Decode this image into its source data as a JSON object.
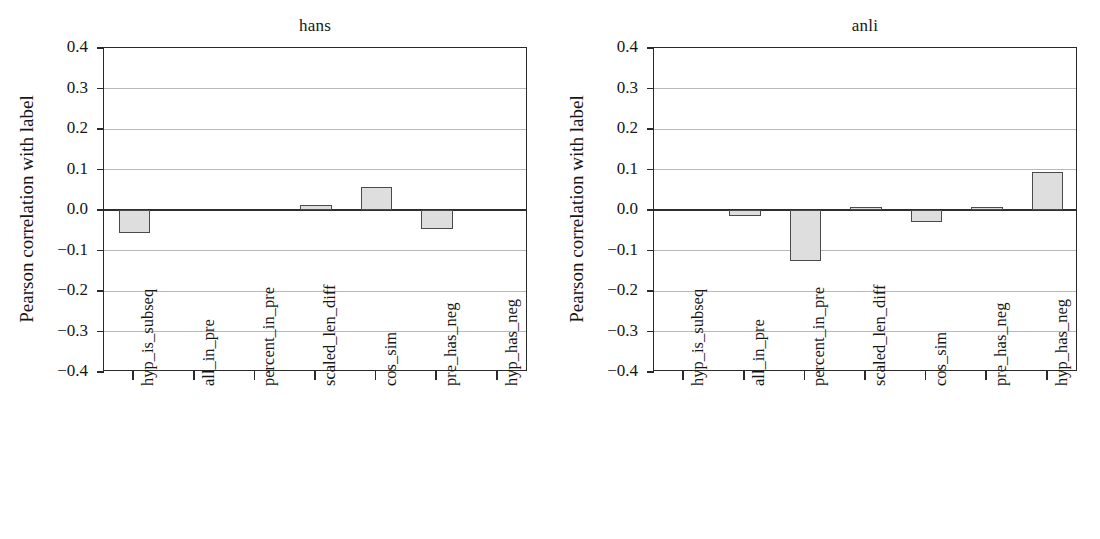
{
  "figure": {
    "ylabel": "Pearson correlation with label",
    "panels": [
      "hans",
      "anli"
    ]
  },
  "chart_data": [
    {
      "type": "bar",
      "title": "hans",
      "xlabel": "",
      "ylabel": "Pearson correlation with label",
      "ylim": [
        -0.4,
        0.4
      ],
      "yticks": [
        "0.4",
        "0.3",
        "0.2",
        "0.1",
        "0.0",
        "−0.1",
        "−0.2",
        "−0.3",
        "−0.4"
      ],
      "ytick_values": [
        0.4,
        0.3,
        0.2,
        0.1,
        0.0,
        -0.1,
        -0.2,
        -0.3,
        -0.4
      ],
      "grid": true,
      "legend": "none",
      "bar_facecolor": "#dedede",
      "bar_edgecolor": "#4a4a4a",
      "categories": [
        "hyp_is_subseq",
        "all_in_pre",
        "percent_in_pre",
        "scaled_len_diff",
        "cos_sim",
        "pre_has_neg",
        "hyp_has_neg"
      ],
      "values": [
        -0.056,
        0.0,
        0.0,
        0.012,
        0.056,
        -0.048,
        0.0
      ]
    },
    {
      "type": "bar",
      "title": "anli",
      "xlabel": "",
      "ylabel": "Pearson correlation with label",
      "ylim": [
        -0.4,
        0.4
      ],
      "yticks": [
        "0.4",
        "0.3",
        "0.2",
        "0.1",
        "0.0",
        "−0.1",
        "−0.2",
        "−0.3",
        "−0.4"
      ],
      "ytick_values": [
        0.4,
        0.3,
        0.2,
        0.1,
        0.0,
        -0.1,
        -0.2,
        -0.3,
        -0.4
      ],
      "grid": true,
      "legend": "none",
      "bar_facecolor": "#dedede",
      "bar_edgecolor": "#4a4a4a",
      "categories": [
        "hyp_is_subseq",
        "all_in_pre",
        "percent_in_pre",
        "scaled_len_diff",
        "cos_sim",
        "pre_has_neg",
        "hyp_has_neg"
      ],
      "values": [
        0.0,
        -0.016,
        -0.126,
        0.008,
        -0.03,
        0.007,
        0.094
      ]
    }
  ]
}
